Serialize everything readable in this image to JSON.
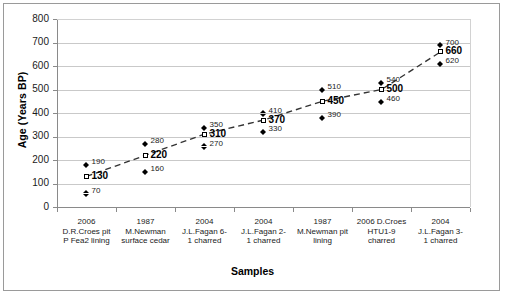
{
  "chart_data": {
    "type": "scatter",
    "title": "",
    "xlabel": "Samples",
    "ylabel": "Age (Years BP)",
    "ylim": [
      0,
      800
    ],
    "ytick_values": [
      0,
      100,
      200,
      300,
      400,
      500,
      600,
      700,
      800
    ],
    "grid": true,
    "legend": "none",
    "categories": [
      "2006 D.R.Croes pit P Fea2 lining",
      "1987 M.Newman surface cedar",
      "2004 J.L.Fagan 6- 1 charred",
      "2004 J.L.Fagan 2- 1 charred",
      "1987 M.Newman pit lining",
      "2006 D.Croes HTU1-9 charred",
      "2004 J.L.Fagan 3- 1 charred"
    ],
    "category_lines": [
      [
        "2006",
        "D.R.Croes  pit",
        "P Fea2 lining"
      ],
      [
        "1987",
        "M.Newman",
        "surface cedar"
      ],
      [
        "2004",
        "J.L.Fagan  6-",
        "1 charred"
      ],
      [
        "2004",
        "J.L.Fagan  2-",
        "1 charred"
      ],
      [
        "1987",
        "M.Newman pit",
        "lining"
      ],
      [
        "2006  D.Croes",
        "HTU1-9",
        "charred"
      ],
      [
        "2004",
        "J.L.Fagan  3-",
        "1 charred"
      ]
    ],
    "series": [
      {
        "name": "upper",
        "marker": "filled-diamond",
        "values": [
          190,
          280,
          350,
          410,
          510,
          540,
          700
        ]
      },
      {
        "name": "mean",
        "marker": "open-square",
        "values": [
          130,
          220,
          310,
          370,
          450,
          500,
          660
        ]
      },
      {
        "name": "lower",
        "marker": "filled-diamond",
        "values": [
          70,
          160,
          270,
          330,
          390,
          460,
          620
        ]
      }
    ],
    "trendline": {
      "style": "dashed",
      "color": "#333333",
      "from": [
        130,
        220,
        310,
        370,
        450,
        500,
        660
      ]
    }
  },
  "axis": {
    "y_title": "Age (Years BP)",
    "x_title": "Samples",
    "ticks": [
      "800",
      "700",
      "600",
      "500",
      "400",
      "300",
      "200",
      "100",
      "0"
    ]
  }
}
